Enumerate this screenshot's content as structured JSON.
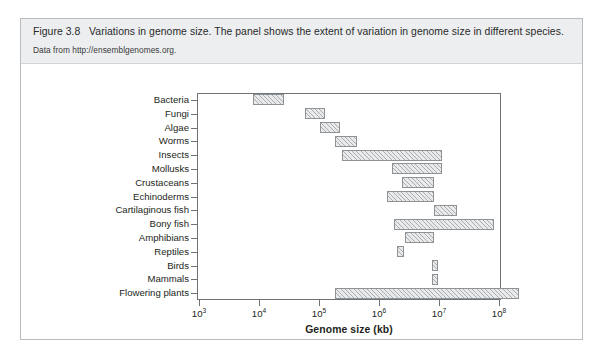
{
  "figure": {
    "label": "Figure 3.8",
    "caption": "Variations in genome size. The panel shows the extent of variation in genome size in different species.",
    "source": "Data from http://ensemblgenomes.org."
  },
  "colors": {
    "caption_band": "#eceef0",
    "card_border": "#b9bcbe",
    "axis": "#6e7376",
    "bar_fill": "#e9eaec",
    "bar_edge": "#8e9295",
    "text": "#231f20"
  },
  "chart_data": {
    "type": "bar",
    "orientation": "horizontal",
    "title": "",
    "xlabel": "Genome size (kb)",
    "ylabel": "",
    "xscale": "log",
    "xlim": [
      1000,
      100000000
    ],
    "xticks": [
      1000,
      10000,
      100000,
      1000000,
      10000000,
      100000000
    ],
    "xtick_labels": [
      "10³",
      "10⁴",
      "10⁵",
      "10⁶",
      "10⁷",
      "10⁸"
    ],
    "xtick_mantissa": [
      "10",
      "10",
      "10",
      "10",
      "10",
      "10"
    ],
    "xtick_exponents": [
      "3",
      "4",
      "5",
      "6",
      "7",
      "8"
    ],
    "grid": false,
    "legend": null,
    "categories": [
      "Bacteria",
      "Fungi",
      "Algae",
      "Worms",
      "Insects",
      "Mollusks",
      "Crustaceans",
      "Echinoderms",
      "Cartilaginous fish",
      "Bony fish",
      "Amphibians",
      "Reptiles",
      "Birds",
      "Mammals",
      "Flowering plants"
    ],
    "ranges_kb": [
      {
        "category": "Bacteria",
        "min": 3000,
        "max": 13000
      },
      {
        "category": "Fungi",
        "min": 27000,
        "max": 115000
      },
      {
        "category": "Algae",
        "min": 75000,
        "max": 320000
      },
      {
        "category": "Worms",
        "min": 210000,
        "max": 1200000
      },
      {
        "category": "Insects",
        "min": 260000,
        "max": 55000000
      },
      {
        "category": "Mollusks",
        "min": 4300000,
        "max": 55000000
      },
      {
        "category": "Crustaceans",
        "min": 8500000,
        "max": 28000000
      },
      {
        "category": "Echinoderms",
        "min": 2700000,
        "max": 28000000
      },
      {
        "category": "Cartilaginous fish",
        "min": 28000000,
        "max": 120000000
      },
      {
        "category": "Bony fish",
        "min": 3500000,
        "max": 540000000
      },
      {
        "category": "Amphibians",
        "min": 6200000,
        "max": 28000000
      },
      {
        "category": "Reptiles",
        "min": 3800000,
        "max": 5200000
      },
      {
        "category": "Birds",
        "min": 24000000,
        "max": 30000000
      },
      {
        "category": "Mammals",
        "min": 24000000,
        "max": 30000000
      },
      {
        "category": "Flowering plants",
        "min": 190000,
        "max": 93000000
      }
    ],
    "bars_px": [
      {
        "category": "Bacteria",
        "left": 55,
        "width": 31,
        "row": 0
      },
      {
        "category": "Fungi",
        "left": 107,
        "width": 20,
        "row": 1
      },
      {
        "category": "Algae",
        "left": 122,
        "width": 20,
        "row": 2
      },
      {
        "category": "Worms",
        "left": 137,
        "width": 22,
        "row": 3
      },
      {
        "category": "Insects",
        "left": 144,
        "width": 100,
        "row": 4
      },
      {
        "category": "Mollusks",
        "left": 194,
        "width": 50,
        "row": 5
      },
      {
        "category": "Crustaceans",
        "left": 204,
        "width": 32,
        "row": 6
      },
      {
        "category": "Echinoderms",
        "left": 189,
        "width": 47,
        "row": 7
      },
      {
        "category": "Cartilaginous fish",
        "left": 236,
        "width": 23,
        "row": 8
      },
      {
        "category": "Bony fish",
        "left": 196,
        "width": 100,
        "row": 9
      },
      {
        "category": "Amphibians",
        "left": 207,
        "width": 29,
        "row": 10
      },
      {
        "category": "Reptiles",
        "left": 199,
        "width": 7,
        "row": 11
      },
      {
        "category": "Birds",
        "left": 234,
        "width": 6,
        "row": 12
      },
      {
        "category": "Mammals",
        "left": 234,
        "width": 6,
        "row": 13
      },
      {
        "category": "Flowering plants",
        "left": 137,
        "width": 184,
        "row": 14
      }
    ]
  }
}
